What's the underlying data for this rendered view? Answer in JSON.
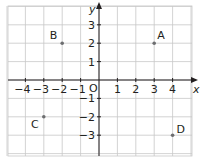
{
  "chart_data": {
    "type": "scatter",
    "title": "",
    "xlabel": "x",
    "ylabel": "y",
    "origin_label": "O",
    "xlim": [
      -5,
      5
    ],
    "ylim": [
      -4,
      4
    ],
    "grid": true,
    "x_ticks": [
      "-4",
      "-3",
      "-2",
      "-1",
      "1",
      "2",
      "3",
      "4"
    ],
    "y_ticks": [
      "3",
      "2",
      "1",
      "-1",
      "-2",
      "-3"
    ],
    "points": [
      {
        "label": "A",
        "x": 3,
        "y": 2
      },
      {
        "label": "B",
        "x": -2,
        "y": 2
      },
      {
        "label": "C",
        "x": -3,
        "y": -2
      },
      {
        "label": "D",
        "x": 4,
        "y": -3
      }
    ]
  },
  "colors": {
    "grid": "#c8c8c8",
    "axis": "#231f20",
    "point": "#6d6e70",
    "text": "#231f20"
  }
}
